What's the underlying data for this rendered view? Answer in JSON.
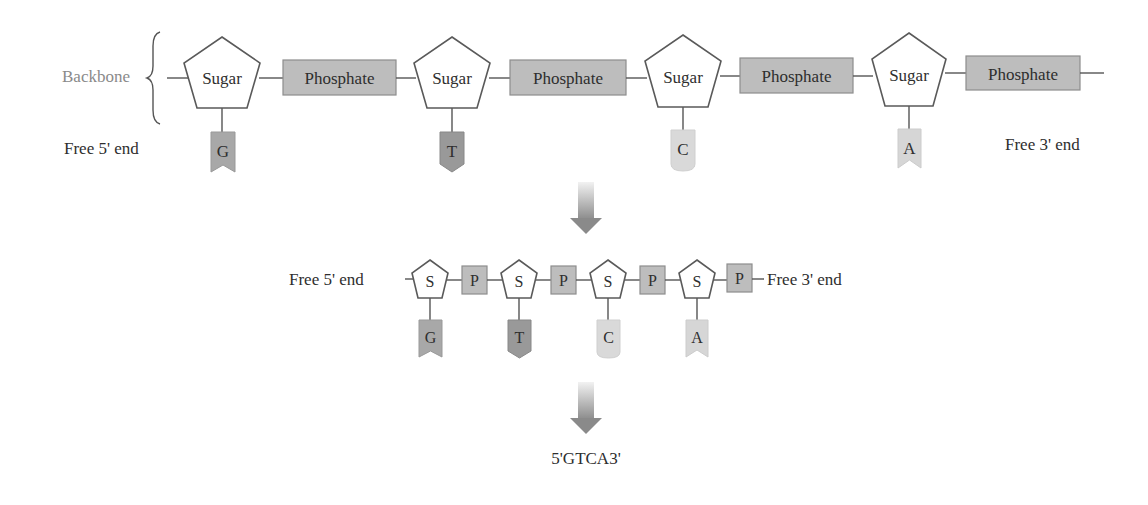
{
  "diagram": {
    "top_row": {
      "backbone_label": "Backbone",
      "free_5_end": "Free 5' end",
      "free_3_end": "Free 3' end",
      "sugar_label": "Sugar",
      "phosphate_label": "Phosphate",
      "nucleotides": [
        {
          "sugar": "Sugar",
          "phosphate": "Phosphate",
          "base": "G",
          "base_shape": "notched",
          "base_color": "#a8a8a8"
        },
        {
          "sugar": "Sugar",
          "phosphate": "Phosphate",
          "base": "T",
          "base_shape": "pointed",
          "base_color": "#999999"
        },
        {
          "sugar": "Sugar",
          "phosphate": "Phosphate",
          "base": "C",
          "base_shape": "rounded",
          "base_color": "#d9d9d9"
        },
        {
          "sugar": "Sugar",
          "phosphate": "Phosphate",
          "base": "A",
          "base_shape": "notched",
          "base_color": "#d6d6d6"
        }
      ]
    },
    "middle_row": {
      "free_5_end": "Free 5' end",
      "free_3_end": "Free 3' end",
      "nucleotides": [
        {
          "sugar": "S",
          "phosphate": "P",
          "base": "G"
        },
        {
          "sugar": "S",
          "phosphate": "P",
          "base": "T"
        },
        {
          "sugar": "S",
          "phosphate": "P",
          "base": "C"
        },
        {
          "sugar": "S",
          "phosphate": "P",
          "base": "A"
        }
      ]
    },
    "sequence": "5'GTCA3'",
    "arrows": [
      "down-arrow",
      "down-arrow"
    ],
    "colors": {
      "phosphate_fill": "#bdbdbd",
      "sugar_stroke": "#5a5a5a",
      "arrow": "#8c8c8c",
      "backbone_label": "#8a8a8a"
    }
  }
}
